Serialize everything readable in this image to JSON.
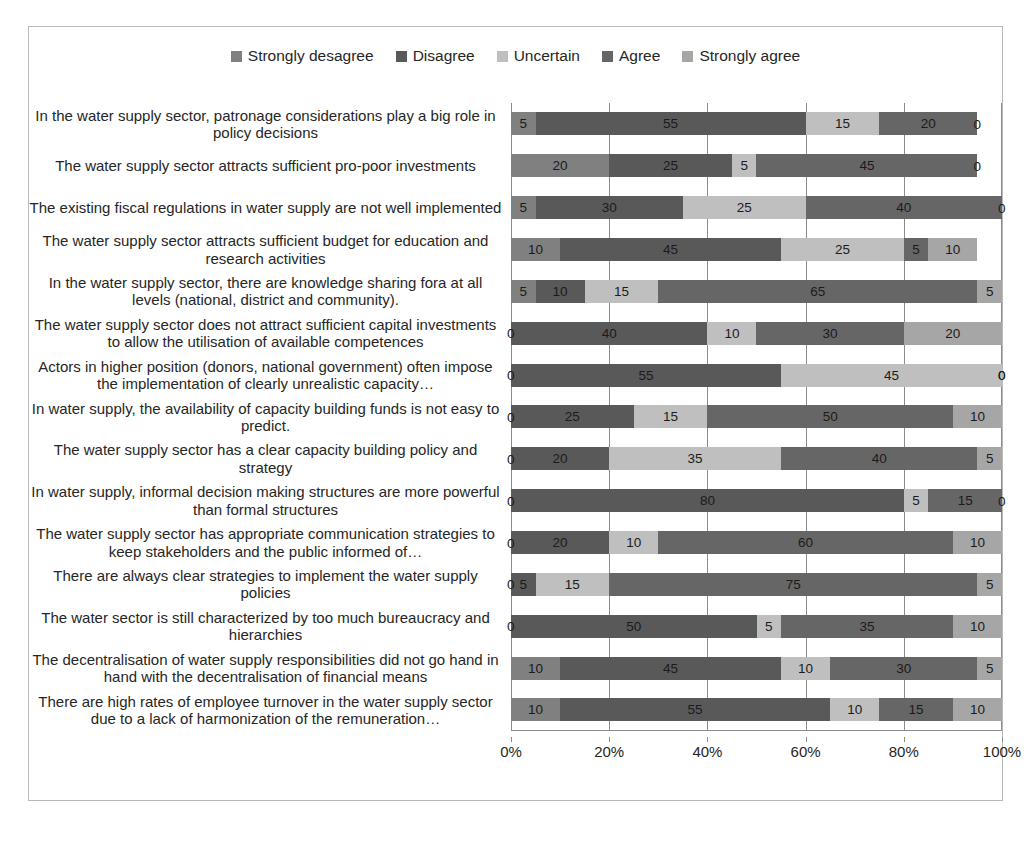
{
  "chart_data": {
    "type": "bar",
    "subtype": "100% stacked horizontal bar",
    "title": "",
    "xlabel": "",
    "ylabel": "",
    "xlim": [
      0,
      100
    ],
    "xticks": [
      "0%",
      "20%",
      "40%",
      "60%",
      "80%",
      "100%"
    ],
    "xtick_values": [
      0,
      20,
      40,
      60,
      80,
      100
    ],
    "grid": true,
    "legend_position": "top-center",
    "series": [
      {
        "name": "Strongly desagree",
        "color": "#808080"
      },
      {
        "name": "Disagree",
        "color": "#595959"
      },
      {
        "name": "Uncertain",
        "color": "#bfbfbf"
      },
      {
        "name": "Agree",
        "color": "#666666"
      },
      {
        "name": "Strongly agree",
        "color": "#a6a6a6"
      }
    ],
    "categories": [
      "In the water supply sector, patronage considerations play a big role in policy decisions",
      "The water supply sector attracts sufficient pro-poor investments",
      "The existing fiscal regulations in water supply are not well implemented",
      "The water supply sector attracts sufficient budget for education and research activities",
      "In the water supply sector, there are knowledge sharing fora at all levels (national, district and community).",
      "The water supply sector does not attract sufficient capital investments to allow the utilisation of available competences",
      "Actors in higher position (donors, national government) often impose the implementation of clearly unrealistic capacity…",
      "In water supply, the availability of capacity building funds is not easy to predict.",
      "The water supply sector has a clear capacity building policy and strategy",
      "In water supply, informal decision making structures are more powerful than formal structures",
      "The water supply sector has appropriate communication strategies to keep stakeholders and the public informed of…",
      "There are always clear strategies to implement the water supply policies",
      "The water sector is still characterized by too much bureaucracy and hierarchies",
      "The decentralisation of water supply responsibilities did not go hand in hand with the decentralisation of financial means",
      "There are high rates of employee turnover in the water supply sector due to a lack of harmonization of the remuneration…"
    ],
    "values": [
      [
        5,
        55,
        15,
        20,
        0
      ],
      [
        20,
        25,
        5,
        45,
        0
      ],
      [
        5,
        30,
        25,
        40,
        0
      ],
      [
        10,
        45,
        25,
        5,
        10
      ],
      [
        5,
        10,
        15,
        65,
        5
      ],
      [
        0,
        40,
        10,
        30,
        20
      ],
      [
        0,
        55,
        45,
        0,
        0
      ],
      [
        0,
        25,
        15,
        50,
        10
      ],
      [
        0,
        20,
        35,
        40,
        5
      ],
      [
        0,
        80,
        5,
        15,
        0
      ],
      [
        0,
        20,
        10,
        60,
        10
      ],
      [
        0,
        5,
        15,
        75,
        5
      ],
      [
        0,
        50,
        5,
        35,
        10
      ],
      [
        10,
        45,
        10,
        30,
        5
      ],
      [
        10,
        55,
        10,
        15,
        10
      ]
    ]
  },
  "caption": ""
}
